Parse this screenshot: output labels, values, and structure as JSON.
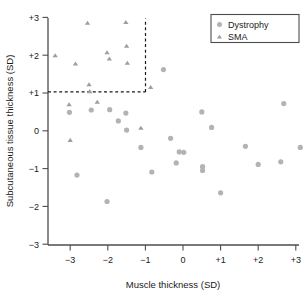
{
  "chart_data": {
    "type": "scatter",
    "title": "",
    "xlabel": "Muscle thickness (SD)",
    "ylabel": "Subcutaneous tissue thickness (SD)",
    "xlim": [
      -3.5,
      3.2
    ],
    "ylim": [
      -3,
      3
    ],
    "xticks": [
      -3,
      -2,
      -1,
      0,
      1,
      2,
      3
    ],
    "xtick_labels": [
      "−3",
      "−2",
      "−1",
      "0",
      "+1",
      "+2",
      "+3"
    ],
    "yticks": [
      -3,
      -2,
      -1,
      0,
      1,
      2,
      3
    ],
    "ytick_labels": [
      "−3",
      "−2",
      "−1",
      "0",
      "+1",
      "+2",
      "+3"
    ],
    "grid": false,
    "legend_position": "top-right",
    "annotations": [
      {
        "name": "threshold-lines",
        "description": "dashed reference lines at y = +1 and x = -1",
        "y_value": 1,
        "x_value": -1
      }
    ],
    "series": [
      {
        "name": "Dystrophy",
        "marker": "circle",
        "color": "#b3b3b3",
        "points": [
          [
            -3.02,
            0.49
          ],
          [
            -2.82,
            -1.17
          ],
          [
            -2.44,
            0.55
          ],
          [
            -2.02,
            -1.87
          ],
          [
            -1.95,
            0.56
          ],
          [
            -1.72,
            0.26
          ],
          [
            -1.52,
            0.47
          ],
          [
            -1.5,
            0.02
          ],
          [
            -1.12,
            -0.44
          ],
          [
            -0.83,
            -1.09
          ],
          [
            -0.52,
            1.62
          ],
          [
            -0.33,
            -0.2
          ],
          [
            -0.18,
            -0.85
          ],
          [
            -0.1,
            -0.56
          ],
          [
            0.02,
            -0.57
          ],
          [
            0.5,
            0.5
          ],
          [
            0.52,
            -0.95
          ],
          [
            0.52,
            -1.05
          ],
          [
            0.76,
            0.09
          ],
          [
            1.0,
            -1.64
          ],
          [
            1.66,
            -0.41
          ],
          [
            2.0,
            -0.89
          ],
          [
            2.6,
            -0.82
          ],
          [
            2.68,
            0.72
          ],
          [
            3.12,
            -0.44
          ]
        ]
      },
      {
        "name": "SMA",
        "marker": "triangle",
        "color": "#b3b3b3",
        "points": [
          [
            -3.4,
            1.99
          ],
          [
            -3.03,
            0.69
          ],
          [
            -3.0,
            -0.25
          ],
          [
            -2.86,
            1.77
          ],
          [
            -2.54,
            2.85
          ],
          [
            -2.5,
            1.22
          ],
          [
            -2.48,
            1.04
          ],
          [
            -2.28,
            0.76
          ],
          [
            -2.02,
            2.07
          ],
          [
            -1.96,
            1.9
          ],
          [
            -1.52,
            2.87
          ],
          [
            -1.5,
            2.24
          ],
          [
            -1.48,
            1.79
          ],
          [
            -1.12,
            0.07
          ],
          [
            -0.86,
            1.15
          ]
        ]
      }
    ]
  },
  "legend": {
    "entries": [
      {
        "label": "Dystrophy",
        "marker": "circle"
      },
      {
        "label": "SMA",
        "marker": "triangle"
      }
    ]
  },
  "colors": {
    "marker": "#b3b3b3",
    "axis": "#4d4d4d",
    "text": "#1a1a1a",
    "background": "#ffffff"
  }
}
